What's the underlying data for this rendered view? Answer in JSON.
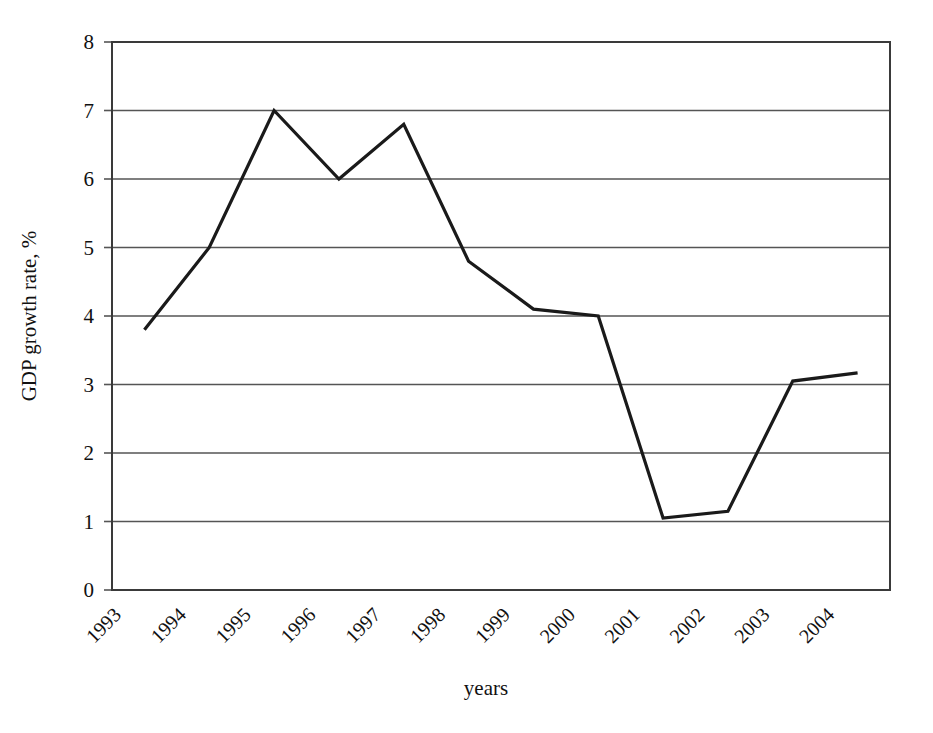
{
  "chart_data": {
    "type": "line",
    "title": "",
    "xlabel": "years",
    "ylabel": "GDP growth rate, %",
    "categories": [
      "1993",
      "1994",
      "1995",
      "1996",
      "1997",
      "1998",
      "1999",
      "2000",
      "2001",
      "2002",
      "2003",
      "2004"
    ],
    "values": [
      3.8,
      5.0,
      7.0,
      6.0,
      6.8,
      4.8,
      4.1,
      4.0,
      1.05,
      1.15,
      3.05,
      3.17
    ],
    "series": [
      {
        "name": "GDP growth rate",
        "values": [
          3.8,
          5.0,
          7.0,
          6.0,
          6.8,
          4.8,
          4.1,
          4.0,
          1.05,
          1.15,
          3.05,
          3.17
        ]
      }
    ],
    "ylim": [
      0,
      8
    ],
    "yticks": [
      0,
      1,
      2,
      3,
      4,
      5,
      6,
      7,
      8
    ],
    "ytick_labels": [
      "0",
      "1",
      "2",
      "3",
      "4",
      "5",
      "6",
      "7",
      "8"
    ],
    "grid": "horizontal",
    "legend": "none",
    "line_color": "#1a1a1a",
    "grid_color": "#555555",
    "axis_color": "#3a3a3a",
    "background_color": "#ffffff",
    "xtick_rotation": -45,
    "markers": "none"
  }
}
